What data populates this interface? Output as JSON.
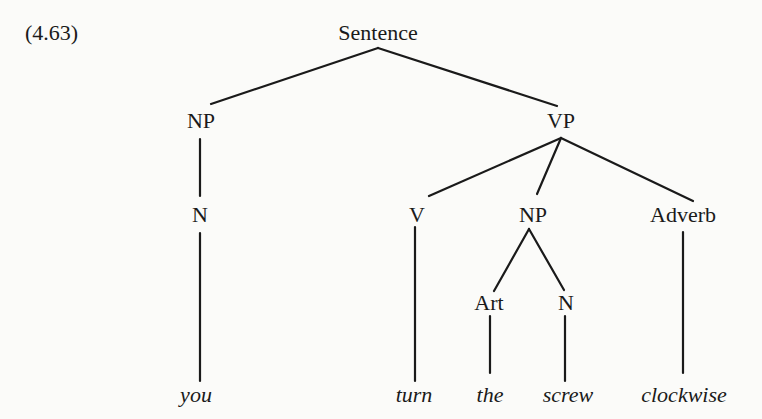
{
  "example_number": "(4.63)",
  "tree": {
    "root": "Sentence",
    "nodes": {
      "sentence": "Sentence",
      "np_subject": "NP",
      "vp": "VP",
      "n_subject": "N",
      "v": "V",
      "np_object": "NP",
      "adverb": "Adverb",
      "art": "Art",
      "n_object": "N"
    },
    "words": {
      "you": "you",
      "turn": "turn",
      "the": "the",
      "screw": "screw",
      "clockwise": "clockwise"
    },
    "structure": {
      "label": "Sentence",
      "children": [
        {
          "label": "NP",
          "children": [
            {
              "label": "N",
              "children": [
                {
                  "word": "you"
                }
              ]
            }
          ]
        },
        {
          "label": "VP",
          "children": [
            {
              "label": "V",
              "children": [
                {
                  "word": "turn"
                }
              ]
            },
            {
              "label": "NP",
              "children": [
                {
                  "label": "Art",
                  "children": [
                    {
                      "word": "the"
                    }
                  ]
                },
                {
                  "label": "N",
                  "children": [
                    {
                      "word": "screw"
                    }
                  ]
                }
              ]
            },
            {
              "label": "Adverb",
              "children": [
                {
                  "word": "clockwise"
                }
              ]
            }
          ]
        }
      ]
    }
  }
}
